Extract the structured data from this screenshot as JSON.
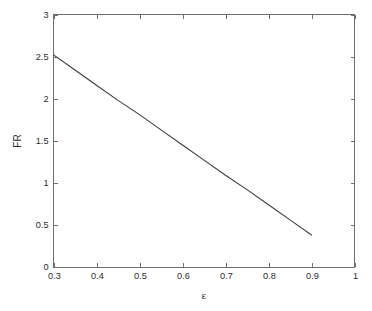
{
  "chart_data": {
    "type": "line",
    "title": "",
    "xlabel": "ε",
    "ylabel": "FR",
    "xlim": [
      0.3,
      1
    ],
    "ylim": [
      0,
      3
    ],
    "grid": false,
    "legend": null,
    "box": true,
    "tick_direction": "in",
    "xticks": [
      0.3,
      0.4,
      0.5,
      0.6,
      0.7,
      0.8,
      0.9,
      1
    ],
    "xtick_labels": [
      "0.3",
      "0.4",
      "0.5",
      "0.6",
      "0.7",
      "0.8",
      "0.9",
      "1"
    ],
    "yticks": [
      0,
      0.5,
      1,
      1.5,
      2,
      2.5,
      3
    ],
    "ytick_labels": [
      "0",
      "0.5",
      "1",
      "1.5",
      "2",
      "2.5",
      "3"
    ],
    "series": [
      {
        "name": "FR",
        "color": "#3a3a3a",
        "style": "solid",
        "x": [
          0.3,
          0.35,
          0.4,
          0.45,
          0.5,
          0.55,
          0.6,
          0.65,
          0.7,
          0.75,
          0.8,
          0.85,
          0.9
        ],
        "y": [
          2.52,
          2.34,
          2.16,
          1.98,
          1.81,
          1.63,
          1.45,
          1.27,
          1.09,
          0.92,
          0.74,
          0.56,
          0.38
        ]
      }
    ]
  },
  "figure": {
    "background_color": "#ffffff",
    "axis_color": "#6e6e6e",
    "text_color": "#2b2b2b"
  }
}
